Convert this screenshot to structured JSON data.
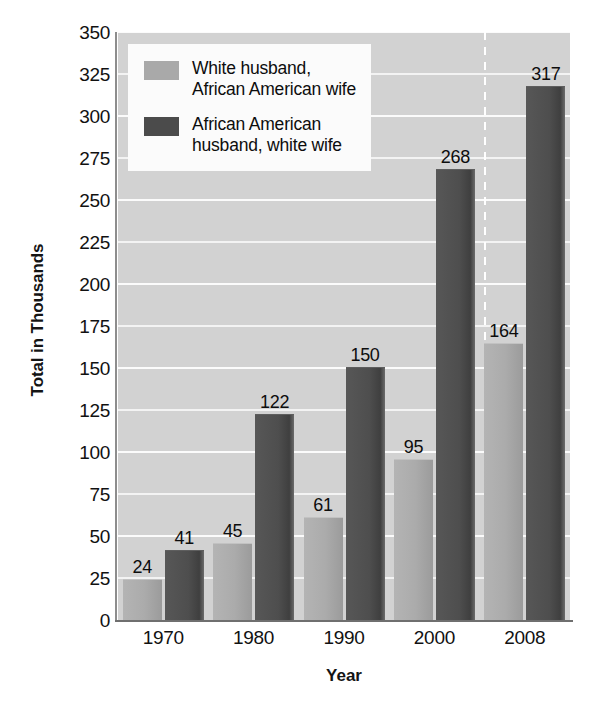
{
  "chart_data": {
    "type": "bar",
    "title": "",
    "xlabel": "Year",
    "ylabel": "Total in Thousands",
    "categories": [
      "1970",
      "1980",
      "1990",
      "2000",
      "2008"
    ],
    "series": [
      {
        "name": "White husband,\nAfrican American wife",
        "color": "#a9a9a9",
        "values": [
          24,
          45,
          61,
          95,
          164
        ]
      },
      {
        "name": "African American\nhusband, white wife",
        "color": "#4b4b4b",
        "values": [
          41,
          122,
          150,
          268,
          317
        ]
      }
    ],
    "ylim": [
      0,
      350
    ],
    "ytick_step": 25,
    "yticks": [
      "0",
      "25",
      "50",
      "75",
      "100",
      "125",
      "150",
      "175",
      "200",
      "225",
      "250",
      "275",
      "300",
      "325",
      "350"
    ],
    "grid": true,
    "grid_orientation": "horizontal",
    "legend_position": "top-left",
    "annotations": {
      "value_labels": true,
      "vertical_dashed_divider_between": [
        "2000",
        "2008"
      ]
    },
    "colors": {
      "plot_background": "#d2d2d2",
      "gridline": "#f4f4f4",
      "axis": "#6f6f6f",
      "text": "#111111",
      "legend_background": "#fbfbfb"
    }
  }
}
